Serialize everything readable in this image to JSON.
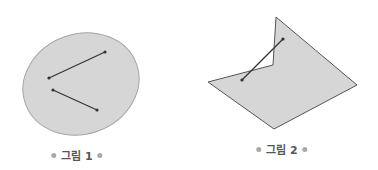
{
  "figures": [
    {
      "caption": "그림 1",
      "shape": "ellipse",
      "description": "convex region with two segments inside",
      "fill": "#d6d6d6",
      "stroke": "#999999",
      "segments": [
        {
          "x1": 49,
          "y1": 78,
          "x2": 105,
          "y2": 52
        },
        {
          "x1": 53,
          "y1": 90,
          "x2": 97,
          "y2": 110
        }
      ]
    },
    {
      "caption": "그림 2",
      "shape": "polygon",
      "description": "non-convex region with one segment crossing outside",
      "fill": "#d6d6d6",
      "stroke": "#555555",
      "segments": [
        {
          "x1": 242,
          "y1": 80,
          "x2": 283,
          "y2": 39
        }
      ]
    }
  ],
  "colors": {
    "segment": "#333333",
    "caption_dot": "#a9a9a9",
    "caption_text": "#555555"
  }
}
